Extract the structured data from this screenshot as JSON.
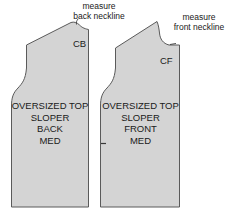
{
  "figure": {
    "type": "sewing-pattern-diagram",
    "background_color": "#ffffff",
    "piece_fill_color": "#d4d4d4",
    "piece_stroke_color": "#5a5a5a",
    "text_color": "#1a1a1a"
  },
  "annotations": {
    "back_neckline": {
      "line1": "measure",
      "line2": "back neckline",
      "full": "measure back neckline"
    },
    "front_neckline": {
      "line1": "measure",
      "line2": "front neckline",
      "full": "measure front neckline"
    }
  },
  "pieces": [
    {
      "id": "back",
      "center_marker": "CB",
      "center_marker_meaning": "center-back",
      "label_lines": [
        "OVERSIZED TOP",
        "SLOPER",
        "BACK",
        "MED"
      ],
      "title": "OVERSIZED TOP",
      "sloper": "SLOPER",
      "side": "BACK",
      "size": "MED"
    },
    {
      "id": "front",
      "center_marker": "CF",
      "center_marker_meaning": "center-front",
      "label_lines": [
        "OVERSIZED TOP",
        "SLOPER",
        "FRONT",
        "MED"
      ],
      "title": "OVERSIZED TOP",
      "sloper": "SLOPER",
      "side": "FRONT",
      "size": "MED"
    }
  ],
  "marks": {
    "front_side_notch": "notch"
  }
}
